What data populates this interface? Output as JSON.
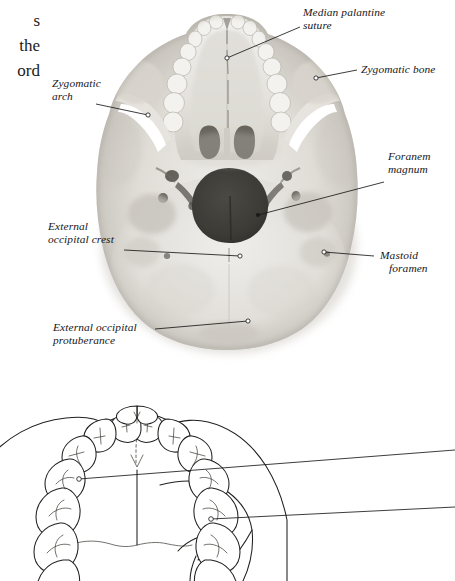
{
  "figure": {
    "kind": "anatomy-figure",
    "title_visible": false,
    "body_text_fragment": {
      "lines": [
        "s",
        "the",
        "ord"
      ]
    },
    "photo": {
      "name": "skull-inferior-view-photograph",
      "description": "Grayscale photograph of a human skull viewed from below (inferior view)",
      "colors": {
        "bone_light": "#e9e7e2",
        "bone_mid": "#c9c6bf",
        "bone_shadow": "#9a968e",
        "foramen_dark": "#3b3a36",
        "background": "#ffffff"
      }
    },
    "drawing": {
      "name": "hard-palate-line-drawing",
      "description": "Partial line drawing of the hard palate and upper dental arch, cropped at the bottom of the page",
      "colors": {
        "ink": "#20201f",
        "fill": "#ffffff"
      }
    },
    "labels": [
      {
        "id": "median-palatine-suture",
        "lines": [
          "Median palantine",
          "suture"
        ],
        "side": "right",
        "indent_second": false
      },
      {
        "id": "zygomatic-bone",
        "lines": [
          "Zygomatic bone"
        ],
        "side": "right",
        "indent_second": false
      },
      {
        "id": "zygomatic-arch",
        "lines": [
          "Zygomatic",
          "arch"
        ],
        "side": "left",
        "indent_second": false
      },
      {
        "id": "foranem-magnum",
        "lines": [
          "Foranem",
          "magnum"
        ],
        "side": "right",
        "indent_second": false
      },
      {
        "id": "external-occipital-crest",
        "lines": [
          "External",
          "occipital crest"
        ],
        "side": "left",
        "indent_second": false
      },
      {
        "id": "mastoid-foramen",
        "lines": [
          "Mastoid",
          "foramen"
        ],
        "side": "right",
        "indent_second": true
      },
      {
        "id": "external-occipital-protuberance",
        "lines": [
          "External occipital",
          "protuberance"
        ],
        "side": "left",
        "indent_second": false
      }
    ],
    "unlabeled_leaders": [
      {
        "id": "drawing-leader-upper",
        "note": "leader line from palate midline running off the right edge"
      },
      {
        "id": "drawing-leader-lower",
        "note": "leader line from lateral palate margin running off the right edge"
      }
    ]
  }
}
